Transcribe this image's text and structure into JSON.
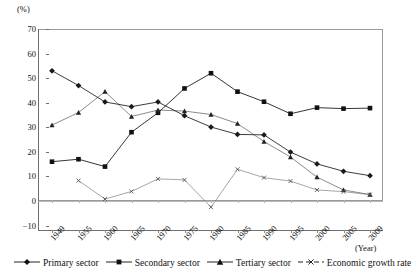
{
  "chart_data": {
    "type": "line",
    "title": "",
    "xlabel": "(Year)",
    "ylabel": "(%)",
    "ylim": [
      -10,
      70
    ],
    "yticks": [
      70,
      60,
      50,
      40,
      30,
      20,
      10,
      0,
      -10
    ],
    "grid": false,
    "legend_position": "bottom",
    "categories": [
      "1949",
      "1955",
      "1960",
      "1965",
      "1970",
      "1975",
      "1980",
      "1985",
      "1990",
      "1995",
      "2000",
      "2005",
      "2009"
    ],
    "series": [
      {
        "name": "Primary sector",
        "marker": "diamond",
        "color": "#1a1a1a",
        "values": [
          53.0,
          47.0,
          40.3,
          38.4,
          40.3,
          34.7,
          30.1,
          27.1,
          26.9,
          19.9,
          15.1,
          12.1,
          10.3
        ]
      },
      {
        "name": "Secondary sector",
        "marker": "square",
        "color": "#111111",
        "values": [
          16.0,
          17.0,
          14.0,
          28.0,
          35.9,
          45.8,
          52.0,
          44.5,
          40.4,
          35.5,
          38.0,
          37.6,
          37.8
        ]
      },
      {
        "name": "Tertiary sector",
        "marker": "triangle",
        "color": "#222222",
        "values": [
          30.9,
          36.0,
          44.5,
          34.4,
          37.0,
          36.6,
          35.2,
          31.5,
          24.2,
          17.9,
          9.7,
          4.5,
          2.6
        ]
      },
      {
        "name": "Economic growth rate",
        "marker": "x",
        "color": "#555555",
        "values": [
          null,
          8.3,
          0.8,
          3.9,
          9.0,
          8.6,
          -2.5,
          12.9,
          9.5,
          8.1,
          4.5,
          3.8,
          2.6
        ]
      }
    ]
  },
  "axis": {
    "y_unit": "(%)",
    "x_unit": "(Year)",
    "y_ticks": [
      "70",
      "60",
      "50",
      "40",
      "30",
      "20",
      "10",
      "0",
      "-10"
    ],
    "x_ticks": [
      "1949",
      "1955",
      "1960",
      "1965",
      "1970",
      "1975",
      "1980",
      "1985",
      "1990",
      "1995",
      "2000",
      "2005",
      "2009"
    ]
  },
  "legend": {
    "items": [
      {
        "label": "Primary sector",
        "marker": "diamond-marker"
      },
      {
        "label": "Secondary sector",
        "marker": "square-marker"
      },
      {
        "label": "Tertiary sector",
        "marker": "triangle-marker"
      },
      {
        "label": "Economic growth rate",
        "marker": "x-marker"
      }
    ]
  }
}
